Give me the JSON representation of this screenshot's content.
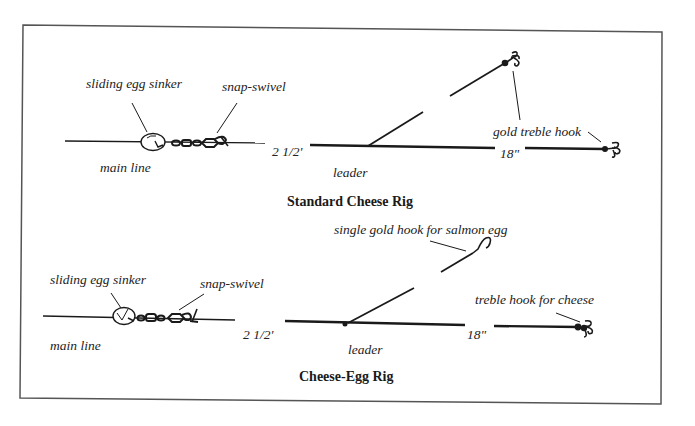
{
  "diagram": {
    "frame_color": "#555555",
    "line_color": "#1a1a1a",
    "rigs": [
      {
        "title": "Standard Cheese Rig",
        "labels": {
          "sinker": "sliding egg sinker",
          "swivel": "snap-swivel",
          "main_line": "main line",
          "main_length": "2 1/2'",
          "leader": "leader",
          "leader_length": "18\"",
          "hook": "gold treble hook"
        }
      },
      {
        "title": "Cheese-Egg Rig",
        "labels": {
          "sinker": "sliding egg sinker",
          "swivel": "snap-swivel",
          "main_line": "main line",
          "main_length": "2 1/2'",
          "leader": "leader",
          "leader_length": "18\"",
          "egg_hook": "single gold hook for salmon egg",
          "hook": "treble hook for cheese"
        }
      }
    ]
  }
}
